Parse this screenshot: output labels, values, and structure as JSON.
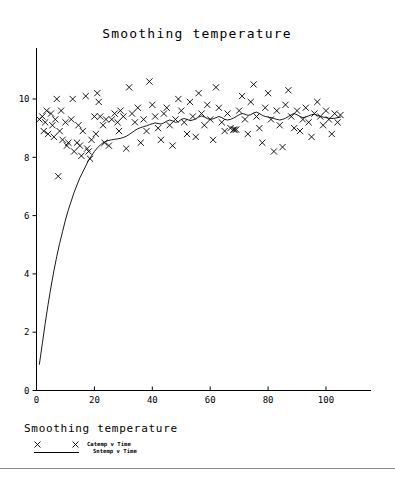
{
  "chart_data": {
    "type": "scatter",
    "title": "Smoothing temperature",
    "xlabel": "",
    "ylabel": "",
    "xlim": [
      0,
      115
    ],
    "ylim": [
      0,
      11
    ],
    "xticks": [
      0,
      20,
      40,
      60,
      80,
      100
    ],
    "yticks": [
      0,
      2,
      4,
      6,
      8,
      10
    ],
    "grid": false,
    "legend_position": "below-plot",
    "legend_title": "Smoothing temperature",
    "series": [
      {
        "name": "Catemp v Time",
        "type": "scatter",
        "marker": "x",
        "points": [
          [
            1,
            9.3
          ],
          [
            2,
            9.4
          ],
          [
            2.5,
            8.9
          ],
          [
            3,
            9.2
          ],
          [
            3.5,
            9.6
          ],
          [
            4,
            8.8
          ],
          [
            5,
            9.5
          ],
          [
            5.5,
            9.1
          ],
          [
            6,
            8.7
          ],
          [
            6.5,
            9.3
          ],
          [
            7,
            10.0
          ],
          [
            7.5,
            7.35
          ],
          [
            8,
            8.9
          ],
          [
            8.5,
            9.6
          ],
          [
            9,
            8.6
          ],
          [
            10,
            9.2
          ],
          [
            10.5,
            8.4
          ],
          [
            11,
            8.5
          ],
          [
            12,
            9.3
          ],
          [
            12.5,
            10.0
          ],
          [
            13,
            8.2
          ],
          [
            14,
            8.5
          ],
          [
            14.5,
            9.1
          ],
          [
            15,
            8.4
          ],
          [
            15.5,
            8.05
          ],
          [
            16,
            8.9
          ],
          [
            17,
            10.1
          ],
          [
            17.5,
            8.3
          ],
          [
            18,
            8.2
          ],
          [
            18.5,
            7.95
          ],
          [
            19,
            8.6
          ],
          [
            20,
            9.4
          ],
          [
            20.5,
            8.8
          ],
          [
            21,
            10.2
          ],
          [
            21.5,
            9.9
          ],
          [
            22,
            9.4
          ],
          [
            23,
            9.1
          ],
          [
            23.5,
            8.5
          ],
          [
            24,
            9.3
          ],
          [
            25,
            8.4
          ],
          [
            26,
            9.3
          ],
          [
            27,
            9.5
          ],
          [
            28,
            9.2
          ],
          [
            28.5,
            8.9
          ],
          [
            29,
            9.6
          ],
          [
            30,
            9.4
          ],
          [
            31,
            8.3
          ],
          [
            32,
            10.4
          ],
          [
            33,
            9.5
          ],
          [
            34,
            9.2
          ],
          [
            35,
            9.7
          ],
          [
            36,
            8.5
          ],
          [
            37,
            9.3
          ],
          [
            38,
            8.9
          ],
          [
            39,
            10.6
          ],
          [
            40,
            9.8
          ],
          [
            41,
            9.4
          ],
          [
            42,
            9.0
          ],
          [
            43,
            8.6
          ],
          [
            44,
            9.5
          ],
          [
            45,
            9.7
          ],
          [
            46,
            9.1
          ],
          [
            47,
            8.4
          ],
          [
            48,
            9.3
          ],
          [
            49,
            10.0
          ],
          [
            50,
            9.6
          ],
          [
            51,
            9.2
          ],
          [
            52,
            8.8
          ],
          [
            53,
            9.9
          ],
          [
            54,
            9.4
          ],
          [
            55,
            8.7
          ],
          [
            56,
            10.2
          ],
          [
            57,
            9.5
          ],
          [
            58,
            9.1
          ],
          [
            59,
            9.8
          ],
          [
            60,
            9.3
          ],
          [
            61,
            8.6
          ],
          [
            62,
            10.4
          ],
          [
            63,
            9.7
          ],
          [
            64,
            9.2
          ],
          [
            65,
            8.9
          ],
          [
            66,
            9.5
          ],
          [
            67,
            9.0
          ],
          [
            68,
            8.95
          ],
          [
            68.5,
            8.95
          ],
          [
            69,
            8.95
          ],
          [
            70,
            9.6
          ],
          [
            71,
            10.1
          ],
          [
            72,
            9.3
          ],
          [
            73,
            8.8
          ],
          [
            74,
            9.9
          ],
          [
            75,
            10.5
          ],
          [
            76,
            9.4
          ],
          [
            77,
            9.0
          ],
          [
            78,
            8.5
          ],
          [
            79,
            9.7
          ],
          [
            80,
            10.2
          ],
          [
            81,
            9.3
          ],
          [
            82,
            8.2
          ],
          [
            83,
            9.6
          ],
          [
            84,
            9.1
          ],
          [
            85,
            8.35
          ],
          [
            86,
            9.8
          ],
          [
            87,
            10.3
          ],
          [
            88,
            9.4
          ],
          [
            89,
            9.0
          ],
          [
            90,
            9.6
          ],
          [
            91,
            8.9
          ],
          [
            92,
            9.3
          ],
          [
            93,
            9.7
          ],
          [
            94,
            9.2
          ],
          [
            95,
            8.7
          ],
          [
            96,
            9.5
          ],
          [
            97,
            9.9
          ],
          [
            98,
            9.4
          ],
          [
            99,
            9.1
          ],
          [
            100,
            9.6
          ],
          [
            101,
            9.3
          ],
          [
            102,
            8.8
          ],
          [
            103,
            9.5
          ],
          [
            104,
            9.2
          ],
          [
            105,
            9.45
          ]
        ]
      },
      {
        "name": "Sntemp v Time",
        "type": "line",
        "points": [
          [
            1,
            0.9
          ],
          [
            2,
            1.6
          ],
          [
            3,
            2.3
          ],
          [
            4,
            2.95
          ],
          [
            5,
            3.55
          ],
          [
            6,
            4.1
          ],
          [
            7,
            4.6
          ],
          [
            8,
            5.05
          ],
          [
            9,
            5.45
          ],
          [
            10,
            5.85
          ],
          [
            11,
            6.2
          ],
          [
            12,
            6.5
          ],
          [
            13,
            6.8
          ],
          [
            14,
            7.05
          ],
          [
            15,
            7.3
          ],
          [
            16,
            7.5
          ],
          [
            17,
            7.7
          ],
          [
            18,
            7.9
          ],
          [
            19,
            8.05
          ],
          [
            20,
            8.2
          ],
          [
            21,
            8.32
          ],
          [
            22,
            8.42
          ],
          [
            23,
            8.5
          ],
          [
            24,
            8.55
          ],
          [
            25,
            8.58
          ],
          [
            26,
            8.6
          ],
          [
            27,
            8.62
          ],
          [
            28,
            8.63
          ],
          [
            29,
            8.65
          ],
          [
            30,
            8.68
          ],
          [
            31,
            8.72
          ],
          [
            32,
            8.78
          ],
          [
            33,
            8.85
          ],
          [
            34,
            8.92
          ],
          [
            35,
            8.98
          ],
          [
            36,
            9.02
          ],
          [
            37,
            9.05
          ],
          [
            38,
            9.08
          ],
          [
            39,
            9.12
          ],
          [
            40,
            9.15
          ],
          [
            41,
            9.18
          ],
          [
            42,
            9.16
          ],
          [
            43,
            9.14
          ],
          [
            44,
            9.18
          ],
          [
            45,
            9.24
          ],
          [
            46,
            9.28
          ],
          [
            47,
            9.25
          ],
          [
            48,
            9.2
          ],
          [
            49,
            9.22
          ],
          [
            50,
            9.3
          ],
          [
            51,
            9.33
          ],
          [
            52,
            9.3
          ],
          [
            53,
            9.26
          ],
          [
            54,
            9.28
          ],
          [
            55,
            9.32
          ],
          [
            56,
            9.38
          ],
          [
            57,
            9.42
          ],
          [
            58,
            9.38
          ],
          [
            59,
            9.33
          ],
          [
            60,
            9.3
          ],
          [
            61,
            9.32
          ],
          [
            62,
            9.36
          ],
          [
            63,
            9.4
          ],
          [
            64,
            9.36
          ],
          [
            65,
            9.3
          ],
          [
            66,
            9.28
          ],
          [
            67,
            9.3
          ],
          [
            68,
            9.34
          ],
          [
            69,
            9.4
          ],
          [
            70,
            9.46
          ],
          [
            71,
            9.5
          ],
          [
            72,
            9.48
          ],
          [
            73,
            9.44
          ],
          [
            74,
            9.46
          ],
          [
            75,
            9.52
          ],
          [
            76,
            9.55
          ],
          [
            77,
            9.5
          ],
          [
            78,
            9.44
          ],
          [
            79,
            9.4
          ],
          [
            80,
            9.38
          ],
          [
            81,
            9.36
          ],
          [
            82,
            9.33
          ],
          [
            83,
            9.3
          ],
          [
            84,
            9.28
          ],
          [
            85,
            9.3
          ],
          [
            86,
            9.34
          ],
          [
            87,
            9.4
          ],
          [
            88,
            9.46
          ],
          [
            89,
            9.5
          ],
          [
            90,
            9.46
          ],
          [
            91,
            9.4
          ],
          [
            92,
            9.36
          ],
          [
            93,
            9.38
          ],
          [
            94,
            9.42
          ],
          [
            95,
            9.46
          ],
          [
            96,
            9.48
          ],
          [
            97,
            9.44
          ],
          [
            98,
            9.4
          ],
          [
            99,
            9.38
          ],
          [
            100,
            9.36
          ],
          [
            101,
            9.34
          ],
          [
            102,
            9.33
          ],
          [
            103,
            9.34
          ],
          [
            104,
            9.36
          ],
          [
            105,
            9.38
          ]
        ]
      }
    ]
  },
  "legend": {
    "title": "Smoothing temperature",
    "entries": [
      {
        "label": "Catemp v Time",
        "marker": "x"
      },
      {
        "label": "Sntemp v Time",
        "marker": "line"
      }
    ]
  },
  "colors": {
    "ink": "#000000",
    "divider": "#8a8a8a",
    "background": "#ffffff"
  }
}
